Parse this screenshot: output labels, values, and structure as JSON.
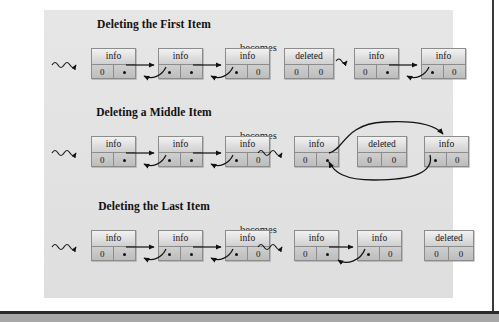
{
  "figure": {
    "kind": "linked-list-deletion-diagram",
    "background_color": "#e3e3e3",
    "page_color": "#ffffff",
    "node_border_color": "#8c8c8c",
    "ink_color": "#121212",
    "becomes_label": "becomes",
    "sections": [
      {
        "id": "first",
        "title": "Deleting the First Item",
        "becomes": "becomes",
        "before": {
          "head_marker": "wavy-head-pointer",
          "nodes": [
            {
              "top": "info",
              "left": "0",
              "right": "pointer-dot"
            },
            {
              "top": "info",
              "left": "pointer-dot",
              "right": "pointer-dot"
            },
            {
              "top": "info",
              "left": "pointer-dot",
              "right": "0"
            }
          ]
        },
        "after": {
          "head_marker": "wavy-head-pointer",
          "nodes": [
            {
              "top": "deleted",
              "left": "0",
              "right": "0"
            },
            {
              "top": "info",
              "left": "0",
              "right": "pointer-dot"
            },
            {
              "top": "info",
              "left": "pointer-dot",
              "right": "0"
            }
          ]
        }
      },
      {
        "id": "middle",
        "title": "Deleting a Middle Item",
        "becomes": "becomes",
        "before": {
          "head_marker": "wavy-head-pointer",
          "nodes": [
            {
              "top": "info",
              "left": "0",
              "right": "pointer-dot"
            },
            {
              "top": "info",
              "left": "pointer-dot",
              "right": "pointer-dot"
            },
            {
              "top": "info",
              "left": "pointer-dot",
              "right": "0"
            }
          ]
        },
        "after": {
          "head_marker": "wavy-head-pointer",
          "nodes": [
            {
              "top": "info",
              "left": "0",
              "right": "pointer-dot"
            },
            {
              "top": "deleted",
              "left": "0",
              "right": "0"
            },
            {
              "top": "info",
              "left": "pointer-dot",
              "right": "0"
            }
          ]
        }
      },
      {
        "id": "last",
        "title": "Deleting the Last Item",
        "becomes": "becomes",
        "before": {
          "head_marker": "wavy-head-pointer",
          "nodes": [
            {
              "top": "info",
              "left": "0",
              "right": "pointer-dot"
            },
            {
              "top": "info",
              "left": "pointer-dot",
              "right": "pointer-dot"
            },
            {
              "top": "info",
              "left": "pointer-dot",
              "right": "0"
            }
          ]
        },
        "after": {
          "head_marker": "wavy-head-pointer",
          "nodes": [
            {
              "top": "info",
              "left": "0",
              "right": "pointer-dot"
            },
            {
              "top": "info",
              "left": "pointer-dot",
              "right": "0"
            },
            {
              "top": "deleted",
              "left": "0",
              "right": "0"
            }
          ]
        }
      }
    ]
  }
}
